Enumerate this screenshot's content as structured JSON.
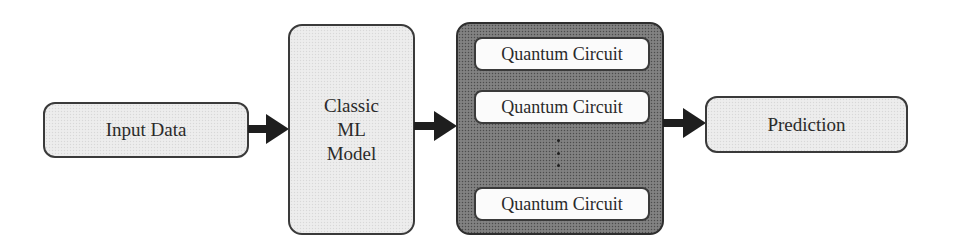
{
  "diagram": {
    "type": "pipeline-flowchart",
    "direction": "left-to-right",
    "nodes": {
      "input": {
        "label": "Input Data"
      },
      "classic_model": {
        "lines": [
          "Classic",
          "ML",
          "Model"
        ]
      },
      "quantum_ensemble": {
        "circuits": [
          {
            "label": "Quantum Circuit"
          },
          {
            "label": "Quantum Circuit"
          },
          {
            "label": "Quantum Circuit"
          }
        ],
        "ellipsis": "vertical-dots"
      },
      "prediction": {
        "label": "Prediction"
      }
    },
    "edges": [
      {
        "from": "Input Data",
        "to": "Classic ML Model"
      },
      {
        "from": "Classic ML Model",
        "to": "Quantum Circuits"
      },
      {
        "from": "Quantum Circuits",
        "to": "Prediction"
      }
    ],
    "colors": {
      "light_fill": "#ebebeb",
      "dark_fill": "#7a7a7a",
      "circuit_fill": "#fbfbfb",
      "stroke": "#3a3a3a",
      "arrow": "#1e1e1e",
      "text": "#2a2a2a"
    }
  }
}
